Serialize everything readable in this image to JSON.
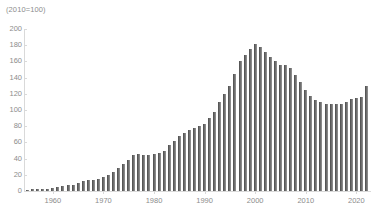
{
  "chart_data": {
    "type": "bar",
    "title": "",
    "subtitle": "",
    "unit_note": "(2010=100)",
    "xlabel": "",
    "ylabel": "",
    "ylim": [
      0,
      200
    ],
    "y_ticks": [
      0,
      20,
      40,
      60,
      80,
      100,
      120,
      140,
      160,
      180,
      200
    ],
    "x_ticks": [
      1960,
      1970,
      1980,
      1990,
      2000,
      2010,
      2020
    ],
    "grid": false,
    "legend": null,
    "bar_color": "#6e6e6e",
    "axis_color": "#d9d9d9",
    "text_color": "#8c8c8c",
    "categories": [
      1955,
      1956,
      1957,
      1958,
      1959,
      1960,
      1961,
      1962,
      1963,
      1964,
      1965,
      1966,
      1967,
      1968,
      1969,
      1970,
      1971,
      1972,
      1973,
      1974,
      1975,
      1976,
      1977,
      1978,
      1979,
      1980,
      1981,
      1982,
      1983,
      1984,
      1985,
      1986,
      1987,
      1988,
      1989,
      1990,
      1991,
      1992,
      1993,
      1994,
      1995,
      1996,
      1997,
      1998,
      1999,
      2000,
      2001,
      2002,
      2003,
      2004,
      2005,
      2006,
      2007,
      2008,
      2009,
      2010,
      2011,
      2012,
      2013,
      2014,
      2015,
      2016,
      2017,
      2018,
      2019,
      2020,
      2021,
      2022
    ],
    "values": [
      1,
      2,
      2,
      3,
      3,
      4,
      5,
      6,
      7,
      8,
      10,
      12,
      13,
      14,
      15,
      17,
      20,
      24,
      29,
      33,
      38,
      45,
      46,
      45,
      45,
      46,
      47,
      50,
      57,
      62,
      68,
      72,
      75,
      78,
      80,
      83,
      90,
      98,
      110,
      120,
      130,
      145,
      160,
      168,
      175,
      182,
      178,
      172,
      165,
      160,
      155,
      156,
      152,
      143,
      135,
      125,
      117,
      112,
      110,
      108,
      107,
      107,
      107,
      110,
      113,
      115,
      116,
      130
    ]
  }
}
